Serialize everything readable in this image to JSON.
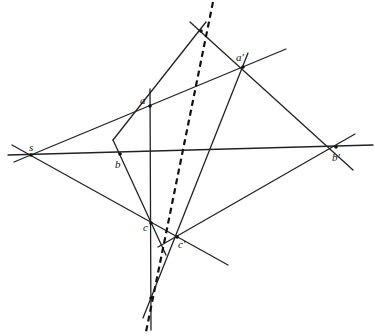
{
  "diagram": {
    "type": "perspective / Desargues configuration",
    "colors": {
      "line": "#222222",
      "background": "#ffffff"
    },
    "points": [
      {
        "id": "s",
        "label": "s",
        "x": 31,
        "y": 155,
        "lx": 29,
        "ly": 151
      },
      {
        "id": "a",
        "label": "a",
        "x": 150,
        "y": 106,
        "lx": 140,
        "ly": 104
      },
      {
        "id": "b",
        "label": "b",
        "x": 120,
        "y": 154,
        "lx": 115,
        "ly": 168
      },
      {
        "id": "c",
        "label": "c",
        "x": 151,
        "y": 223,
        "lx": 143,
        "ly": 231
      },
      {
        "id": "a2",
        "label": "a′",
        "x": 243,
        "y": 67,
        "lx": 236,
        "ly": 61
      },
      {
        "id": "b2",
        "label": "b′",
        "x": 336,
        "y": 147,
        "lx": 332,
        "ly": 161
      },
      {
        "id": "c2",
        "label": "c′",
        "x": 177,
        "y": 237,
        "lx": 178,
        "ly": 248
      },
      {
        "id": "o",
        "label": "",
        "x": 201,
        "y": 31
      },
      {
        "id": "p",
        "label": "",
        "x": 151,
        "y": 298
      }
    ],
    "lines": [
      {
        "id": "sa-line",
        "x1": 14,
        "y1": 162,
        "x2": 286,
        "y2": 49,
        "style": "solid"
      },
      {
        "id": "sb-line",
        "x1": 8,
        "y1": 155,
        "x2": 373,
        "y2": 145,
        "style": "solid"
      },
      {
        "id": "sc-line",
        "x1": 12,
        "y1": 145,
        "x2": 228,
        "y2": 265,
        "style": "solid"
      },
      {
        "id": "vertical-ac",
        "x1": 150,
        "y1": 89,
        "x2": 151,
        "y2": 330,
        "style": "solid"
      },
      {
        "id": "ab-line",
        "x1": 113,
        "y1": 140,
        "x2": 206,
        "y2": 22,
        "style": "solid"
      },
      {
        "id": "bc-line",
        "x1": 113,
        "y1": 140,
        "x2": 166,
        "y2": 255,
        "style": "solid"
      },
      {
        "id": "oa2b2-line",
        "x1": 190,
        "y1": 22,
        "x2": 353,
        "y2": 170,
        "style": "solid"
      },
      {
        "id": "a2c2-line",
        "x1": 248,
        "y1": 53,
        "x2": 143,
        "y2": 318,
        "style": "solid"
      },
      {
        "id": "c2b2-line",
        "x1": 158,
        "y1": 247,
        "x2": 355,
        "y2": 134,
        "style": "solid"
      },
      {
        "id": "axis-dashed",
        "x1": 213,
        "y1": 2,
        "x2": 146,
        "y2": 332,
        "style": "dashed"
      }
    ]
  }
}
